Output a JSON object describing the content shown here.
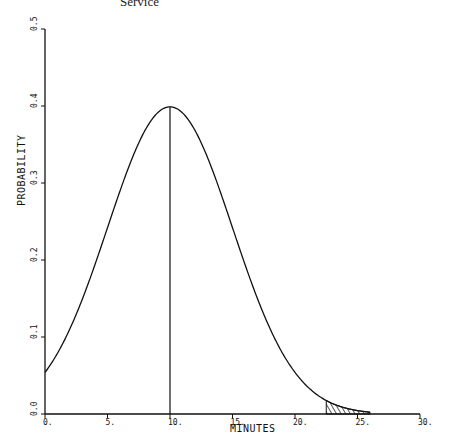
{
  "caption": "Service",
  "chart_data": {
    "type": "line",
    "title": "",
    "xlabel": "MINUTES",
    "ylabel": "PROBABILITY",
    "xlim": [
      0,
      30
    ],
    "ylim": [
      0,
      0.5
    ],
    "x_ticks": [
      "0.",
      "5.",
      "10.",
      "15.",
      "20.",
      "25.",
      "30."
    ],
    "y_ticks": [
      "0.0",
      "0.1",
      "0.2",
      "0.3",
      "0.4",
      "0.5"
    ],
    "grid": false,
    "series": [
      {
        "name": "Normal density (mean 10, sd 5)",
        "mean": 10,
        "sd": 5,
        "x": [
          0,
          2,
          4,
          6,
          8,
          10,
          12,
          14,
          16,
          18,
          20,
          22,
          24,
          26
        ],
        "values": [
          0.054,
          0.111,
          0.194,
          0.29,
          0.368,
          0.399,
          0.368,
          0.29,
          0.194,
          0.111,
          0.054,
          0.022,
          0.008,
          0.002
        ]
      }
    ],
    "annotations": [
      {
        "type": "vertical_line",
        "x": 10,
        "from": 0,
        "to": 0.399,
        "label": "mean"
      },
      {
        "type": "shaded_tail",
        "from_x": 22.5,
        "to_x": 26,
        "pattern": "hatched"
      }
    ]
  }
}
